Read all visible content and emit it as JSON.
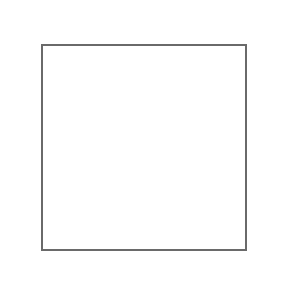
{
  "game": "dominoes",
  "opponent_top": {
    "tiles_in_hand": 4
  },
  "opponent_left": {
    "tiles_in_hand": 2
  },
  "opponent_right": {
    "tiles_in_hand": 2
  },
  "player_hand": [
    {
      "a": 0,
      "b": 6,
      "x": 132,
      "y": 260,
      "o": "v"
    },
    {
      "a": 2,
      "b": 3,
      "x": 148,
      "y": 260,
      "o": "v"
    }
  ],
  "board_tiles": [
    {
      "a": 5,
      "b": 1,
      "x": 57,
      "y": 97,
      "o": "h"
    },
    {
      "a": 1,
      "b": 1,
      "x": 80,
      "y": 94,
      "o": "v"
    },
    {
      "a": 1,
      "b": 4,
      "x": 95,
      "y": 97,
      "o": "h"
    },
    {
      "a": 6,
      "b": 4,
      "x": 119,
      "y": 94,
      "o": "v"
    },
    {
      "a": 4,
      "b": 6,
      "x": 134,
      "y": 97,
      "o": "h"
    },
    {
      "a": 6,
      "b": 1,
      "x": 158,
      "y": 97,
      "o": "h"
    },
    {
      "a": 1,
      "b": 3,
      "x": 166,
      "y": 113,
      "o": "v"
    },
    {
      "a": 5,
      "b": 3,
      "x": 57,
      "y": 110,
      "o": "v"
    },
    {
      "a": 2,
      "b": 0,
      "x": 57,
      "y": 137,
      "o": "v"
    },
    {
      "a": 0,
      "b": 1,
      "x": 57,
      "y": 162,
      "o": "v"
    },
    {
      "a": 1,
      "b": 2,
      "x": 57,
      "y": 185,
      "o": "h"
    },
    {
      "a": 2,
      "b": 5,
      "x": 81,
      "y": 185,
      "o": "h"
    },
    {
      "a": 5,
      "b": 5,
      "x": 105,
      "y": 185,
      "o": "h"
    },
    {
      "a": 5,
      "b": 2,
      "x": 129,
      "y": 185,
      "o": "h"
    },
    {
      "a": 2,
      "b": 6,
      "x": 153,
      "y": 185,
      "o": "h"
    },
    {
      "a": 6,
      "b": 5,
      "x": 177,
      "y": 185,
      "o": "h"
    },
    {
      "a": 1,
      "b": 5,
      "x": 202,
      "y": 176,
      "o": "v"
    },
    {
      "a": 2,
      "b": 2,
      "x": 197,
      "y": 160,
      "o": "h"
    }
  ]
}
